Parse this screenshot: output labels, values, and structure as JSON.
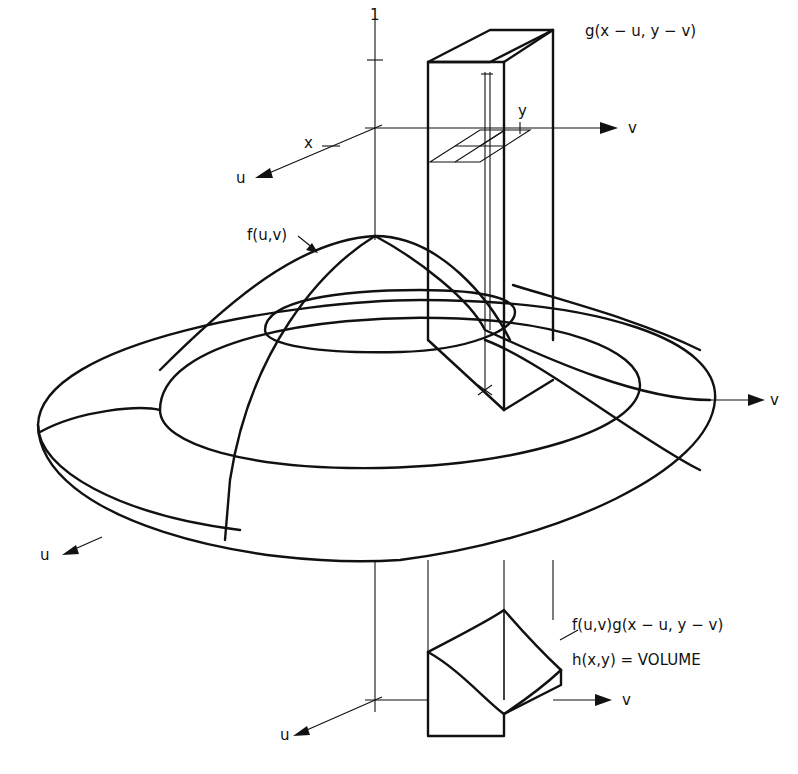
{
  "diagram": {
    "type": "3d-convolution-illustration",
    "labels": {
      "kernel": "g(x − u, y − v)",
      "surface": "f(u,v)",
      "product": "f(u,v)g(x − u, y − v)",
      "result": "h(x,y) = VOLUME",
      "unit_tick": "1"
    },
    "axes": {
      "top": {
        "u": "u",
        "v": "v",
        "x_tick": "x",
        "y_tick": "y"
      },
      "middle": {
        "u": "u",
        "v": "v"
      },
      "bottom": {
        "u": "u",
        "v": "v"
      }
    },
    "stroke_color": "#111111",
    "background_color": "#ffffff"
  }
}
